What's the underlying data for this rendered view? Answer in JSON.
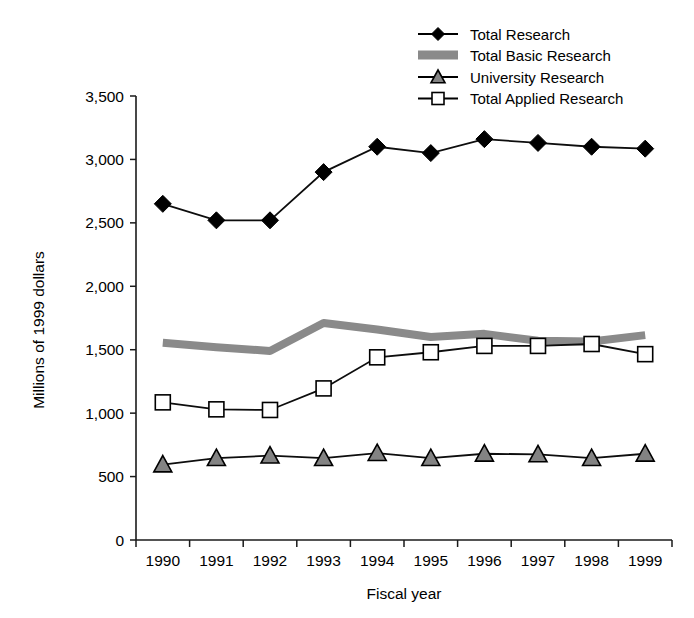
{
  "chart_data": {
    "type": "line",
    "title": "",
    "xlabel": "Fiscal year",
    "ylabel": "Millions of 1999 dollars",
    "categories": [
      "1990",
      "1991",
      "1992",
      "1993",
      "1994",
      "1995",
      "1996",
      "1997",
      "1998",
      "1999"
    ],
    "x": [
      1990,
      1991,
      1992,
      1993,
      1994,
      1995,
      1996,
      1997,
      1998,
      1999
    ],
    "ylim": [
      0,
      3500
    ],
    "yticks": [
      0,
      500,
      1000,
      1500,
      2000,
      2500,
      3000,
      3500
    ],
    "ytick_labels": [
      "0",
      "500",
      "1,000",
      "1,500",
      "2,000",
      "2,500",
      "3,000",
      "3,500"
    ],
    "grid": false,
    "legend_position": "top-right",
    "series": [
      {
        "name": "Total Research",
        "marker": "filled-diamond",
        "color": "#000000",
        "values": [
          2650,
          2520,
          2520,
          2900,
          3100,
          3050,
          3160,
          3130,
          3100,
          3085
        ]
      },
      {
        "name": "Total Basic Research",
        "marker": "shaded-band",
        "color": "#8a8a8a",
        "values": [
          1555,
          1520,
          1490,
          1710,
          1660,
          1600,
          1625,
          1570,
          1565,
          1615
        ]
      },
      {
        "name": "University Research",
        "marker": "filled-triangle",
        "color": "#838383",
        "values": [
          595,
          645,
          665,
          645,
          685,
          645,
          680,
          675,
          645,
          680
        ]
      },
      {
        "name": "Total Applied Research",
        "marker": "open-square",
        "color": "#ffffff",
        "values": [
          1085,
          1030,
          1025,
          1195,
          1440,
          1480,
          1530,
          1530,
          1545,
          1465
        ]
      }
    ]
  },
  "legend": {
    "items": [
      {
        "label": "Total Research",
        "marker": "filled-diamond"
      },
      {
        "label": "Total Basic Research",
        "marker": "shaded-band"
      },
      {
        "label": "University Research",
        "marker": "filled-triangle"
      },
      {
        "label": "Total Applied Research",
        "marker": "open-square"
      }
    ]
  },
  "axes": {
    "y_title": "Millions of 1999 dollars",
    "x_title": "Fiscal year"
  }
}
